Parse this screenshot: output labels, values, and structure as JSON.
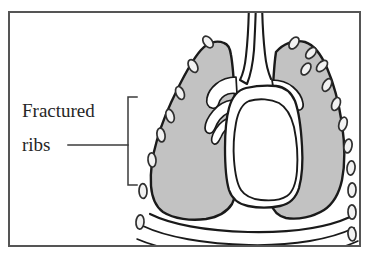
{
  "figure": {
    "type": "medical-illustration",
    "clipped_caption_above_frame": "",
    "frame": {
      "border_color": "#555555",
      "background": "#ffffff"
    },
    "colors": {
      "lung_fill": "#c2c2c2",
      "heart_fill": "#ffffff",
      "outline": "#1a1a1a",
      "rib_fill": "#f2f2f2",
      "rib_outline": "#3a3a3a",
      "frame_border": "#555555",
      "label_text": "#262626",
      "leader_line": "#3b3b3b"
    }
  },
  "annotations": [
    {
      "id": "fractured-ribs",
      "line1": "Fractured",
      "line2": "ribs",
      "leader": "horizontal line from label to bracket",
      "bracket": "open rectangle enclosing left-side rib fragments"
    }
  ],
  "anatomy": {
    "trachea": "midline airway extending above frame",
    "left_lung": "gray shaded lung field, viewer left",
    "right_lung": "gray shaded lung field, viewer right",
    "heart": "white mediastinal silhouette with double outline",
    "bronchi": "white branching airways within both hila",
    "diaphragm": "arched double lines across lower chest",
    "ribs": "small oval fragments along both chest walls"
  }
}
